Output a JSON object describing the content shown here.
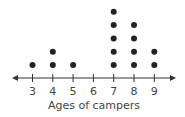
{
  "chart_data": {
    "type": "dot_plot",
    "title": "",
    "xlabel": "Ages of campers",
    "ylabel": "",
    "categories": [
      "3",
      "4",
      "5",
      "6",
      "7",
      "8",
      "9"
    ],
    "values": [
      1,
      2,
      1,
      0,
      5,
      4,
      2
    ],
    "xlim": [
      3,
      9
    ],
    "grid": false,
    "legend": null,
    "axis_arrows": true
  },
  "colors": {
    "dot": "#222222",
    "axis": "#333333",
    "text": "#444444"
  }
}
